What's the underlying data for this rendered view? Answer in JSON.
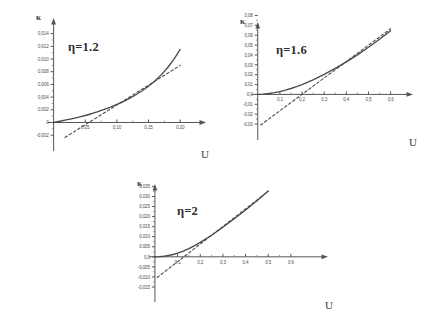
{
  "figure": {
    "title": "",
    "background_color": "#ffffff",
    "axis_color": "#555555",
    "curve_color": "#4a4a4a"
  },
  "chart_data": [
    {
      "id": "panel-1",
      "type": "line",
      "title": "",
      "annotation": "η=1.2",
      "xlabel": "U",
      "ylabel": "κ",
      "xlim": [
        -0.012,
        0.225
      ],
      "ylim": [
        -0.0026,
        0.0152
      ],
      "grid": false,
      "legend": "none",
      "xticks": [
        0.05,
        0.1,
        0.15,
        0.2
      ],
      "xticklabels": [
        "0,05",
        "0,10",
        "0,15",
        "0,20"
      ],
      "yticks": [
        -0.002,
        0,
        0.002,
        0.004,
        0.006,
        0.008,
        0.01,
        0.012,
        0.014
      ],
      "yticklabels": [
        "-0,002",
        "0",
        "0,002",
        "0,004",
        "0,006",
        "0,008",
        "0,010",
        "0,012",
        "0,014"
      ],
      "series": [
        {
          "name": "numerical",
          "style": "solid",
          "x": [
            0.0,
            0.01,
            0.02,
            0.03,
            0.04,
            0.05,
            0.06,
            0.07,
            0.08,
            0.09,
            0.1,
            0.11,
            0.12,
            0.13,
            0.14,
            0.15,
            0.16,
            0.17,
            0.18,
            0.19,
            0.2
          ],
          "y": [
            0.0,
            0.0002,
            0.0004,
            0.00062,
            0.00085,
            0.0011,
            0.00138,
            0.0017,
            0.00205,
            0.00243,
            0.00285,
            0.0033,
            0.0038,
            0.00437,
            0.005,
            0.00572,
            0.00655,
            0.0075,
            0.00862,
            0.00995,
            0.0115
          ]
        },
        {
          "name": "asymptote",
          "style": "dashed",
          "x": [
            0.018,
            0.2
          ],
          "y": [
            -0.00235,
            0.009
          ]
        }
      ]
    },
    {
      "id": "panel-2",
      "type": "line",
      "title": "",
      "annotation": "η=1.6",
      "xlabel": "U",
      "ylabel": "κ",
      "xlim": [
        -0.035,
        0.665
      ],
      "ylim": [
        -0.034,
        0.0855
      ],
      "grid": false,
      "legend": "none",
      "xticks": [
        0.1,
        0.2,
        0.3,
        0.4,
        0.5,
        0.6
      ],
      "xticklabels": [
        "0,1",
        "0,2",
        "0,3",
        "0,4",
        "0,5",
        "0,6"
      ],
      "yticks": [
        -0.03,
        -0.02,
        -0.01,
        0.0,
        0.01,
        0.02,
        0.03,
        0.04,
        0.05,
        0.06,
        0.07,
        0.08
      ],
      "yticklabels": [
        "-0,03",
        "-0,02",
        "-0,01",
        "0,0",
        "0,01",
        "0,02",
        "0,03",
        "0,04",
        "0,05",
        "0,06",
        "0,07",
        "0,08"
      ],
      "series": [
        {
          "name": "numerical",
          "style": "solid",
          "x": [
            0.0,
            0.025,
            0.05,
            0.075,
            0.1,
            0.125,
            0.15,
            0.175,
            0.2,
            0.25,
            0.3,
            0.35,
            0.4,
            0.45,
            0.5,
            0.55,
            0.6
          ],
          "y": [
            0.0,
            0.0003,
            0.0009,
            0.00175,
            0.0029,
            0.0043,
            0.006,
            0.0079,
            0.01,
            0.0148,
            0.0203,
            0.0264,
            0.033,
            0.0401,
            0.0478,
            0.0559,
            0.0645
          ]
        },
        {
          "name": "asymptote",
          "style": "dashed",
          "x": [
            0.013,
            0.6
          ],
          "y": [
            -0.031,
            0.0665
          ]
        }
      ]
    },
    {
      "id": "panel-3",
      "type": "line",
      "title": "",
      "annotation": "η=2",
      "xlabel": "U",
      "ylabel": "κ",
      "xlim": [
        -0.035,
        0.68
      ],
      "ylim": [
        -0.0165,
        0.0372
      ],
      "grid": false,
      "legend": "none",
      "xticks": [
        0.1,
        0.2,
        0.3,
        0.4,
        0.5,
        0.6
      ],
      "xticklabels": [
        "0,1",
        "0,2",
        "0,3",
        "0,4",
        "0,5",
        "0,6"
      ],
      "yticks": [
        -0.015,
        -0.01,
        -0.005,
        0.0,
        0.005,
        0.01,
        0.015,
        0.02,
        0.025,
        0.03,
        0.035
      ],
      "yticklabels": [
        "-0,015",
        "-0,010",
        "-0,005",
        "0,0",
        "0,005",
        "0,010",
        "0,015",
        "0,020",
        "0,025",
        "0,030",
        "0,035"
      ],
      "series": [
        {
          "name": "numerical",
          "style": "solid",
          "x": [
            0.0,
            0.02,
            0.04,
            0.06,
            0.08,
            0.1,
            0.125,
            0.15,
            0.175,
            0.2,
            0.25,
            0.3,
            0.35,
            0.4,
            0.45,
            0.5
          ],
          "y": [
            0.0,
            0.0001,
            0.0003,
            0.00065,
            0.00115,
            0.0018,
            0.00285,
            0.0041,
            0.00555,
            0.00715,
            0.01075,
            0.0147,
            0.0189,
            0.0233,
            0.0279,
            0.0327
          ]
        },
        {
          "name": "asymptote",
          "style": "dashed",
          "x": [
            0.01,
            0.5
          ],
          "y": [
            -0.0103,
            0.0326
          ]
        }
      ]
    }
  ]
}
